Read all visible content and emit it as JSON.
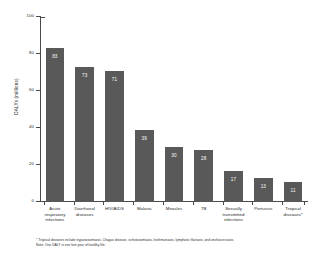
{
  "chart_data": {
    "type": "bar",
    "title": "",
    "xlabel": "",
    "ylabel": "DALYs (millions)",
    "ylim": [
      0,
      100
    ],
    "yticks": [
      0,
      20,
      40,
      60,
      80,
      100
    ],
    "ytick_labels": [
      "0",
      "20",
      "40",
      "60",
      "80",
      "100"
    ],
    "grid": false,
    "legend": null,
    "bar_color": "#595959",
    "value_label_color": "#ffffff",
    "categories": [
      "Acute respiratory infections",
      "Diarrhoeal diseases",
      "HIV/AIDS",
      "Malaria",
      "Measles",
      "TB",
      "Sexually transmitted infections",
      "Pertussis",
      "Tropical diseases*"
    ],
    "values": [
      83,
      73,
      71,
      39,
      30,
      28,
      17,
      13,
      11
    ],
    "value_labels": [
      "83",
      "73",
      "71",
      "39",
      "30",
      "28",
      "17",
      "13",
      "11"
    ]
  },
  "footnotes": {
    "line1": "* Tropical diseases include trypanosomiasis, Chagas disease, schistosomiasis, leishmaniasis, lymphatic filariasis, and onchocerciasis.",
    "line2": "Note: One DALY is one lost year of healthy life."
  }
}
